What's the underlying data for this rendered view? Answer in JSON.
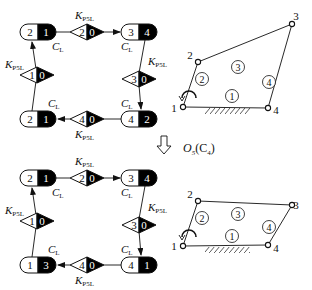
{
  "colors": {
    "ink": "#111111",
    "fill": "#000000",
    "bg": "#ffffff"
  },
  "labels": {
    "K": "K",
    "K_sub": "P5L",
    "C": "C",
    "C_sub": "L"
  },
  "transform": {
    "arrow": "down-arrow-icon",
    "op": "O",
    "op_sub": "5",
    "arg": "(C",
    "arg_sub": "4",
    "close": ")"
  },
  "graphs": [
    {
      "nodes": [
        {
          "id": "tl",
          "left": "2",
          "right": "1"
        },
        {
          "id": "tr",
          "left": "3",
          "right": "4"
        },
        {
          "id": "bl",
          "left": "2",
          "right": "1"
        },
        {
          "id": "br",
          "left": "4",
          "right": "2"
        }
      ],
      "diamonds": [
        {
          "id": "top",
          "left": "2",
          "right": "0"
        },
        {
          "id": "left",
          "left": "1",
          "right": "0"
        },
        {
          "id": "right",
          "left": "3",
          "right": "0"
        },
        {
          "id": "bottom",
          "left": "4",
          "right": "0"
        }
      ]
    },
    {
      "nodes": [
        {
          "id": "tl",
          "left": "2",
          "right": "1"
        },
        {
          "id": "tr",
          "left": "3",
          "right": "4"
        },
        {
          "id": "bl",
          "left": "1",
          "right": "3"
        },
        {
          "id": "br",
          "left": "4",
          "right": "1"
        }
      ],
      "diamonds": [
        {
          "id": "top",
          "left": "2",
          "right": "0"
        },
        {
          "id": "left",
          "left": "1",
          "right": "0"
        },
        {
          "id": "right",
          "left": "3",
          "right": "0"
        },
        {
          "id": "bottom",
          "left": "4",
          "right": "0"
        }
      ]
    }
  ],
  "mechanisms": [
    {
      "joints": [
        "1",
        "2",
        "3",
        "4"
      ],
      "links": [
        "1",
        "2",
        "3",
        "4"
      ]
    },
    {
      "joints": [
        "1",
        "2",
        "3",
        "4"
      ],
      "links": [
        "1",
        "2",
        "3",
        "4"
      ]
    }
  ]
}
